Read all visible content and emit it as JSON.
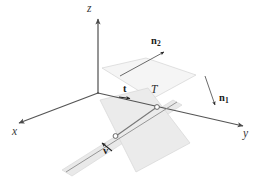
{
  "figure": {
    "kind": "3d-geometry-diagram",
    "background_color": "#ffffff",
    "line_color": "#555555",
    "plane_stroke_color": "#cfcfcf",
    "plane_fill_color": "#ededed",
    "strip_fill_color": "#e6e6e6",
    "label_color": "#2b2b2b"
  },
  "axes": [
    {
      "name": "z",
      "label": "z",
      "label_x": 88,
      "label_y": 4,
      "from_x": 98,
      "from_y": 93,
      "to_x": 98,
      "to_y": 18
    },
    {
      "name": "x",
      "label": "x",
      "label_x": 13,
      "label_y": 127,
      "from_x": 98,
      "from_y": 93,
      "to_x": 18,
      "to_y": 123
    },
    {
      "name": "y",
      "label": "y",
      "label_x": 244,
      "label_y": 129,
      "from_x": 98,
      "from_y": 93,
      "to_x": 244,
      "to_y": 126
    }
  ],
  "vectors": [
    {
      "name": "t",
      "label": "t",
      "subscript": "",
      "label_x": 124,
      "label_y": 87,
      "arrow_from_x": 118,
      "arrow_from_y": 97,
      "arrow_to_x": 131,
      "arrow_to_y": 99
    },
    {
      "name": "n1",
      "label": "n",
      "subscript": "1",
      "label_x": 220,
      "label_y": 95,
      "arrow_from_x": 206,
      "arrow_from_y": 76,
      "arrow_to_x": 216,
      "arrow_to_y": 106
    },
    {
      "name": "n2",
      "label": "n",
      "subscript": "2",
      "label_x": 152,
      "label_y": 38,
      "arrow_from_x": 122,
      "arrow_from_y": 74,
      "arrow_to_x": 166,
      "arrow_to_y": 51
    },
    {
      "name": "v",
      "label": "v",
      "subscript": "",
      "label_x": 104,
      "label_y": 149,
      "arrow_from_x": 114,
      "arrow_from_y": 152,
      "arrow_to_x": 101,
      "arrow_to_y": 142
    }
  ],
  "points": [
    {
      "name": "T",
      "label": "T",
      "label_x": 152,
      "label_y": 86,
      "x": 157,
      "y": 107,
      "marker": "open-circle"
    },
    {
      "name": "lower-point",
      "label": "",
      "label_x": 0,
      "label_y": 0,
      "x": 115,
      "y": 136,
      "marker": "open-circle"
    }
  ],
  "planes": [
    {
      "name": "upper-plane",
      "points": "102,68 146,58 196,75 152,99",
      "fill": "#f4f4f4",
      "stroke": "#d2d2d2"
    },
    {
      "name": "lower-plane",
      "points": "100,100 148,88 190,143 136,172",
      "fill": "#ececec",
      "stroke": "#d6d6d6"
    },
    {
      "name": "tangent-strip",
      "points": "62,170 172,100 181,104 73,176",
      "fill": "#e9e9e9",
      "stroke": "#d8d8d8"
    }
  ],
  "segments": [
    {
      "name": "t-to-lower-point",
      "from_x": 157,
      "from_y": 107,
      "to_x": 115,
      "to_y": 136
    }
  ]
}
